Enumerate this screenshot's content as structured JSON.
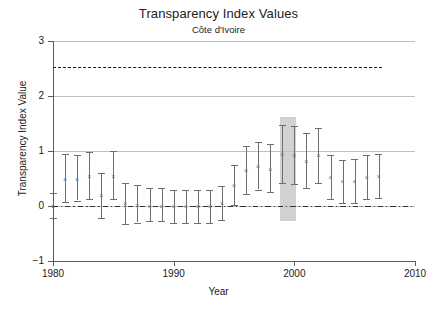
{
  "chart_data": {
    "type": "scatter",
    "title": "Transparency Index Values",
    "subtitle": "Côte d'Ivoire",
    "xlabel": "Year",
    "ylabel": "Transparency Index Value",
    "xlim": [
      1980,
      2010
    ],
    "ylim": [
      -1,
      3
    ],
    "xticks": [
      1980,
      1990,
      2000,
      2010
    ],
    "yticks": [
      -1,
      0,
      1,
      2,
      3
    ],
    "grid": "horizontal",
    "legend": "none",
    "marker": "x",
    "series_name": "Transparency Index Value",
    "reference_lines": [
      {
        "name": "upper-dashed-reference",
        "value": 2.53,
        "style": "dashed",
        "x_start": 1980,
        "x_end": 2007.3
      },
      {
        "name": "zero-reference",
        "value": 0.0,
        "style": "dash-dot",
        "x_start": 1980,
        "x_end": 2010
      }
    ],
    "highlight_band": {
      "name": "highlight-band-1999",
      "x_start": 1998.8,
      "x_end": 2000.1,
      "y_start": -0.27,
      "y_end": 1.62,
      "color": "#d2d2d2"
    },
    "x": [
      1980,
      1981,
      1982,
      1983,
      1984,
      1985,
      1986,
      1987,
      1988,
      1989,
      1990,
      1991,
      1992,
      1993,
      1994,
      1995,
      1996,
      1997,
      1998,
      1999,
      2000,
      2001,
      2002,
      2003,
      2004,
      2005,
      2006,
      2007
    ],
    "values": [
      0.0,
      0.49,
      0.5,
      0.55,
      0.2,
      0.55,
      0.05,
      0.02,
      0.0,
      0.0,
      0.0,
      0.0,
      0.0,
      0.0,
      0.05,
      0.38,
      0.65,
      0.72,
      0.68,
      0.95,
      0.92,
      0.82,
      0.92,
      0.52,
      0.45,
      0.45,
      0.52,
      0.55
    ],
    "ci_low": [
      -0.22,
      0.08,
      0.1,
      0.12,
      -0.22,
      0.12,
      -0.32,
      -0.3,
      -0.28,
      -0.28,
      -0.3,
      -0.3,
      -0.3,
      -0.3,
      -0.26,
      0.02,
      0.22,
      0.3,
      0.26,
      0.42,
      0.4,
      0.32,
      0.42,
      0.12,
      0.06,
      0.05,
      0.12,
      0.15
    ],
    "ci_high": [
      0.24,
      0.95,
      0.92,
      0.98,
      0.6,
      1.0,
      0.42,
      0.38,
      0.32,
      0.32,
      0.3,
      0.3,
      0.3,
      0.3,
      0.36,
      0.74,
      1.1,
      1.16,
      1.12,
      1.48,
      1.45,
      1.32,
      1.42,
      0.92,
      0.84,
      0.85,
      0.92,
      0.95
    ]
  }
}
